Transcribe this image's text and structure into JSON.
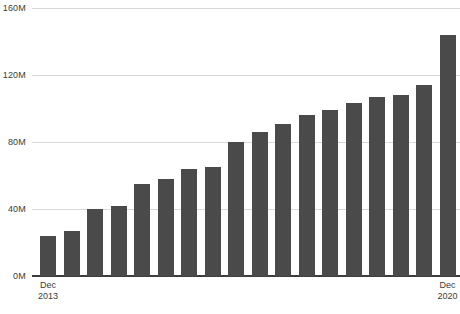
{
  "chart_data": {
    "type": "bar",
    "title": "",
    "subtitle": "",
    "xlabel": "",
    "ylabel": "",
    "ylim": [
      0,
      160
    ],
    "yticks": [
      0,
      40,
      80,
      120,
      160
    ],
    "ytick_labels": [
      "0M",
      "40M",
      "80M",
      "120M",
      "160M"
    ],
    "grid": "horizontal",
    "legend": "none",
    "units": "millions",
    "categories": [
      "Dec 2013",
      "",
      "",
      "",
      "",
      "",
      "",
      "",
      "",
      "",
      "",
      "",
      "",
      "",
      "",
      "",
      "",
      "Dec 2020"
    ],
    "values": [
      24,
      27,
      40,
      42,
      55,
      58,
      64,
      65,
      80,
      86,
      91,
      96,
      99,
      103,
      107,
      108,
      114,
      144
    ],
    "xtick_labels": [
      {
        "line1": "Dec",
        "line2": "2013",
        "index": 0
      },
      {
        "line1": "Dec",
        "line2": "2020",
        "index": 17
      }
    ],
    "colors": {
      "bar": "#4a4a4a",
      "gridline": "#d9d9d9",
      "axis": "#3d3d3d",
      "text": "#3b3b3b",
      "background": "#ffffff"
    }
  }
}
